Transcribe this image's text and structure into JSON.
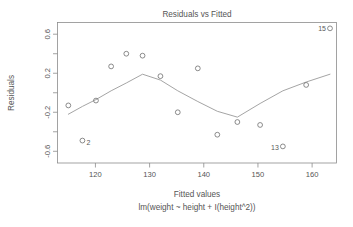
{
  "chart_data": {
    "type": "scatter",
    "title": "Residuals vs Fitted",
    "xlabel": "Fitted values",
    "sublabel": "lm(weight ~ height + I(height^2))",
    "ylabel": "Residuals",
    "xlim": [
      113.0,
      164.5
    ],
    "ylim": [
      -0.72,
      0.72
    ],
    "xticks": [
      120,
      130,
      140,
      150,
      160
    ],
    "xtick_labels": [
      "120",
      "130",
      "140",
      "150",
      "160"
    ],
    "yticks": [
      -0.6,
      -0.2,
      0.2,
      0.6
    ],
    "ytick_labels": [
      "-0.6",
      "-0.2",
      "0.2",
      "0.6"
    ],
    "grid": false,
    "legend": "none",
    "point_symbol": "open-circle",
    "x": [
      115.0,
      117.6,
      120.1,
      122.9,
      125.7,
      128.7,
      132.0,
      135.2,
      138.9,
      142.5,
      146.2,
      150.4,
      154.6,
      158.9,
      163.3
    ],
    "y": [
      -0.13,
      -0.49,
      -0.08,
      0.27,
      0.4,
      0.38,
      0.17,
      -0.2,
      0.25,
      -0.43,
      -0.3,
      -0.33,
      -0.55,
      0.08,
      0.66
    ],
    "labeled_points": [
      {
        "id": "2",
        "x": 117.6,
        "y": -0.49,
        "label_side": "right-below"
      },
      {
        "id": "13",
        "x": 154.6,
        "y": -0.55,
        "label_side": "left-below"
      },
      {
        "id": "15",
        "x": 163.3,
        "y": 0.66,
        "label_side": "left"
      }
    ],
    "smooth_curve": {
      "name": "lowess",
      "x": [
        115.0,
        117.6,
        120.1,
        122.9,
        125.7,
        128.7,
        132.0,
        135.2,
        138.9,
        142.5,
        146.2,
        150.4,
        154.6,
        158.9,
        163.3
      ],
      "y": [
        -0.22,
        -0.14,
        -0.07,
        0.02,
        0.1,
        0.19,
        0.13,
        0.02,
        -0.09,
        -0.19,
        -0.25,
        -0.11,
        0.02,
        0.11,
        0.19
      ]
    }
  }
}
